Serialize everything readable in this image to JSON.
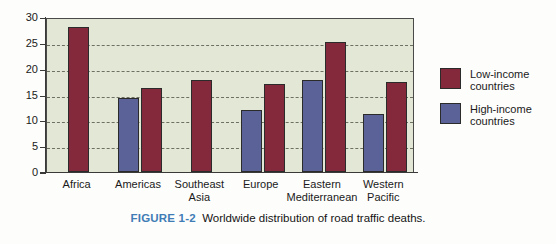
{
  "figure": {
    "caption_tag": "FIGURE 1-2",
    "caption_text": "Worldwide distribution of road traffic deaths."
  },
  "legend": {
    "position": "right",
    "items": [
      {
        "label": "Low-income\ncountries",
        "color": "#84293b",
        "key": "low"
      },
      {
        "label": "High-income\ncountries",
        "color": "#5a6297",
        "key": "high"
      }
    ]
  },
  "axes": {
    "y_ticks": [
      "0",
      "5",
      "10",
      "15",
      "20",
      "25",
      "30"
    ],
    "x_categories": [
      "Africa",
      "Americas",
      "Southeast\nAsia",
      "Europe",
      "Eastern\nMediterranean",
      "Western\nPacific"
    ]
  },
  "colors": {
    "low_income": "#84293b",
    "high_income": "#5a6297",
    "plot_background": "#e3e7d5",
    "frame": "#4a4a48",
    "gridline": "#6e7063",
    "caption_tag": "#3f7cb6"
  },
  "chart_data": {
    "type": "bar",
    "title": "Worldwide distribution of road traffic deaths.",
    "xlabel": "",
    "ylabel": "",
    "ylim": [
      0,
      30
    ],
    "yticks": [
      0,
      5,
      10,
      15,
      20,
      25,
      30
    ],
    "grid": true,
    "grid_axis": "y",
    "legend_position": "right",
    "categories": [
      "Africa",
      "Americas",
      "Southeast Asia",
      "Europe",
      "Eastern Mediterranean",
      "Western Pacific"
    ],
    "series": [
      {
        "name": "High-income countries",
        "color": "#5a6297",
        "values": [
          null,
          14.3,
          null,
          12.0,
          17.8,
          11.3
        ]
      },
      {
        "name": "Low-income countries",
        "color": "#84293b",
        "values": [
          28.0,
          16.3,
          17.9,
          17.0,
          25.2,
          17.5
        ]
      }
    ]
  }
}
